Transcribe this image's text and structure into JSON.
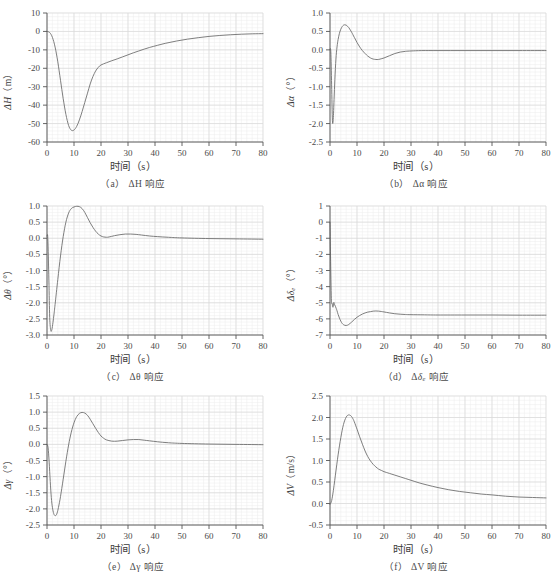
{
  "figure": {
    "background": "#ffffff",
    "line_color": "#6f6f6f",
    "axis_color": "#555555",
    "grid_major_color": "#d8d8d8",
    "grid_minor_color": "#ececec",
    "text_color": "#4a4a4a",
    "xlabel_common": "时间（s）"
  },
  "panels": [
    {
      "id": "a",
      "caption": "（a） ΔH 响应",
      "caption_prefix": "（a）",
      "caption_symbol": "ΔH",
      "caption_suffix": "响应",
      "ylabel_main": "ΔH",
      "ylabel_unit": "（m）",
      "xlabel": "时间（s）"
    },
    {
      "id": "b",
      "caption": "（b） Δα 响应",
      "caption_prefix": "（b）",
      "caption_symbol": "Δα",
      "caption_suffix": "响应",
      "ylabel_main": "Δα",
      "ylabel_unit": "（°）",
      "xlabel": "时间（s）"
    },
    {
      "id": "c",
      "caption": "（c） Δθ 响应",
      "caption_prefix": "（c）",
      "caption_symbol": "Δθ",
      "caption_suffix": "响应",
      "ylabel_main": "Δθ",
      "ylabel_unit": "（°）",
      "xlabel": "时间（s）"
    },
    {
      "id": "d",
      "caption": "（d） Δδe 响应",
      "caption_prefix": "（d）",
      "caption_symbol": "Δδe",
      "caption_suffix": "响应",
      "ylabel_main": "Δδe",
      "ylabel_unit": "（°）",
      "xlabel": "时间（s）"
    },
    {
      "id": "e",
      "caption": "（e） Δγ 响应",
      "caption_prefix": "（e）",
      "caption_symbol": "Δγ",
      "caption_suffix": "响应",
      "ylabel_main": "Δγ",
      "ylabel_unit": "（°）",
      "xlabel": "时间（s）"
    },
    {
      "id": "f",
      "caption": "（f） ΔV 响应",
      "caption_prefix": "（f）",
      "caption_symbol": "ΔV",
      "caption_suffix": "响应",
      "ylabel_main": "ΔV",
      "ylabel_unit": "（m/s）",
      "xlabel": "时间（s）"
    }
  ],
  "chart_data": [
    {
      "panel": "a",
      "type": "line",
      "title": "（a） ΔH 响应",
      "xlabel": "时间（s）",
      "ylabel": "ΔH（m）",
      "xlim": [
        0,
        80
      ],
      "ylim": [
        -60,
        10
      ],
      "xticks": [
        0,
        10,
        20,
        30,
        40,
        50,
        60,
        70,
        80
      ],
      "yticks": [
        10,
        0,
        -10,
        -20,
        -30,
        -40,
        -50,
        -60
      ],
      "grid": true,
      "legend": "none",
      "series": [
        {
          "name": "ΔH",
          "x": [
            0,
            1,
            2,
            3,
            4,
            5,
            6,
            7,
            8,
            9,
            10,
            11,
            12,
            13,
            14,
            15,
            16,
            17,
            18,
            19,
            20,
            22,
            24,
            26,
            28,
            30,
            32,
            34,
            36,
            38,
            40,
            44,
            48,
            52,
            56,
            60,
            64,
            68,
            72,
            76,
            80
          ],
          "y": [
            0,
            -0.6,
            -3.2,
            -8.5,
            -16.5,
            -26.5,
            -36.5,
            -45.0,
            -51.0,
            -53.6,
            -53.5,
            -51.5,
            -48.0,
            -43.5,
            -38.5,
            -33.5,
            -28.5,
            -24.5,
            -21.5,
            -19.5,
            -18.2,
            -17.0,
            -15.9,
            -14.9,
            -13.8,
            -12.7,
            -11.6,
            -10.6,
            -9.6,
            -8.7,
            -7.9,
            -6.4,
            -5.2,
            -4.2,
            -3.4,
            -2.7,
            -2.2,
            -1.8,
            -1.5,
            -1.3,
            -1.2
          ]
        }
      ]
    },
    {
      "panel": "b",
      "type": "line",
      "title": "（b） Δα 响应",
      "xlabel": "时间（s）",
      "ylabel": "Δα（°）",
      "xlim": [
        0,
        80
      ],
      "ylim": [
        -2.5,
        1.0
      ],
      "xticks": [
        0,
        10,
        20,
        30,
        40,
        50,
        60,
        70,
        80
      ],
      "yticks": [
        1.0,
        0.5,
        0.0,
        -0.5,
        -1.0,
        -1.5,
        -2.0,
        -2.5
      ],
      "grid": true,
      "legend": "none",
      "series": [
        {
          "name": "Δα",
          "x": [
            0,
            0.3,
            0.6,
            0.9,
            1.2,
            1.5,
            1.8,
            2.2,
            2.6,
            3.0,
            3.5,
            4.0,
            4.5,
            5.0,
            5.5,
            6.0,
            6.5,
            7.0,
            7.5,
            8.0,
            9.0,
            10.0,
            11.0,
            12.0,
            13.0,
            14.0,
            15.0,
            16.0,
            17.0,
            18.0,
            20.0,
            22.0,
            24.0,
            26.0,
            28.0,
            30.0,
            34.0,
            40.0,
            50.0,
            60.0,
            70.0,
            80.0
          ],
          "y": [
            0.0,
            -0.05,
            -0.95,
            -1.92,
            -1.88,
            -1.35,
            -0.8,
            -0.25,
            0.08,
            0.28,
            0.45,
            0.56,
            0.63,
            0.67,
            0.68,
            0.67,
            0.64,
            0.6,
            0.54,
            0.48,
            0.34,
            0.2,
            0.08,
            -0.02,
            -0.1,
            -0.17,
            -0.22,
            -0.25,
            -0.26,
            -0.26,
            -0.22,
            -0.16,
            -0.1,
            -0.06,
            -0.04,
            -0.03,
            -0.02,
            -0.02,
            -0.02,
            -0.02,
            -0.02,
            -0.02
          ]
        }
      ]
    },
    {
      "panel": "c",
      "type": "line",
      "title": "（c） Δθ 响应",
      "xlabel": "时间（s）",
      "ylabel": "Δθ（°）",
      "xlim": [
        0,
        80
      ],
      "ylim": [
        -3.0,
        1.0
      ],
      "xticks": [
        0,
        10,
        20,
        30,
        40,
        50,
        60,
        70,
        80
      ],
      "yticks": [
        1.0,
        0.5,
        0.0,
        -0.5,
        -1.0,
        -1.5,
        -2.0,
        -2.5,
        -3.0
      ],
      "grid": true,
      "legend": "none",
      "series": [
        {
          "name": "Δθ",
          "x": [
            0,
            0.3,
            0.7,
            1.0,
            1.4,
            1.8,
            2.2,
            2.6,
            3.0,
            4.0,
            5.0,
            6.0,
            7.0,
            8.0,
            9.0,
            10.0,
            11.0,
            12.0,
            13.0,
            14.0,
            15.0,
            16.0,
            17.0,
            18.0,
            19.0,
            20.0,
            21.0,
            22.0,
            23.0,
            25.0,
            27.0,
            29.0,
            31.0,
            33.0,
            35.0,
            38.0,
            41.0,
            45.0,
            50.0,
            60.0,
            70.0,
            80.0
          ],
          "y": [
            0.05,
            0.0,
            -1.3,
            -2.45,
            -2.86,
            -2.83,
            -2.62,
            -2.35,
            -2.05,
            -1.28,
            -0.55,
            0.05,
            0.5,
            0.78,
            0.92,
            0.97,
            0.99,
            0.98,
            0.92,
            0.8,
            0.64,
            0.48,
            0.34,
            0.22,
            0.13,
            0.07,
            0.04,
            0.03,
            0.04,
            0.08,
            0.11,
            0.13,
            0.13,
            0.12,
            0.1,
            0.07,
            0.05,
            0.03,
            0.01,
            -0.01,
            -0.02,
            -0.03
          ]
        }
      ]
    },
    {
      "panel": "d",
      "type": "line",
      "title": "（d） Δδe 响应",
      "xlabel": "时间（s）",
      "ylabel": "Δδe（°）",
      "xlim": [
        0,
        80
      ],
      "ylim": [
        -7,
        1
      ],
      "xticks": [
        0,
        10,
        20,
        30,
        40,
        50,
        60,
        70,
        80
      ],
      "yticks": [
        1,
        0,
        -1,
        -2,
        -3,
        -4,
        -5,
        -6,
        -7
      ],
      "grid": true,
      "legend": "none",
      "series": [
        {
          "name": "Δδe",
          "x": [
            0,
            0.2,
            0.5,
            0.8,
            1.1,
            1.4,
            1.7,
            2.0,
            2.3,
            2.6,
            3.0,
            3.5,
            4.0,
            4.5,
            5.0,
            5.5,
            6.0,
            6.5,
            7.0,
            8.0,
            9.0,
            10.0,
            11.0,
            12.0,
            13.0,
            14.0,
            15.0,
            16.0,
            17.0,
            18.0,
            19.0,
            20.0,
            22.0,
            24.0,
            26.0,
            28.0,
            30.0,
            35.0,
            40.0,
            50.0,
            60.0,
            70.0,
            80.0
          ],
          "y": [
            0.0,
            -2.1,
            -4.75,
            -5.05,
            -5.28,
            -4.98,
            -5.12,
            -5.22,
            -5.35,
            -5.5,
            -5.72,
            -5.95,
            -6.14,
            -6.28,
            -6.36,
            -6.4,
            -6.41,
            -6.39,
            -6.34,
            -6.2,
            -6.04,
            -5.9,
            -5.79,
            -5.7,
            -5.63,
            -5.58,
            -5.55,
            -5.52,
            -5.51,
            -5.52,
            -5.54,
            -5.57,
            -5.63,
            -5.68,
            -5.71,
            -5.73,
            -5.74,
            -5.75,
            -5.76,
            -5.76,
            -5.76,
            -5.77,
            -5.77
          ]
        }
      ]
    },
    {
      "panel": "e",
      "type": "line",
      "title": "（e） Δγ 响应",
      "xlabel": "时间（s）",
      "ylabel": "Δγ（°）",
      "xlim": [
        0,
        80
      ],
      "ylim": [
        -2.5,
        1.5
      ],
      "xticks": [
        0,
        10,
        20,
        30,
        40,
        50,
        60,
        70,
        80
      ],
      "yticks": [
        1.5,
        1.0,
        0.5,
        0.0,
        -0.5,
        -1.0,
        -1.5,
        -2.0,
        -2.5
      ],
      "grid": true,
      "legend": "none",
      "series": [
        {
          "name": "Δγ",
          "x": [
            0,
            0.4,
            0.8,
            1.2,
            1.6,
            2.0,
            2.5,
            3.0,
            3.5,
            4.0,
            4.5,
            5.0,
            6.0,
            7.0,
            8.0,
            9.0,
            10.0,
            11.0,
            12.0,
            13.0,
            14.0,
            15.0,
            16.0,
            17.0,
            18.0,
            19.0,
            20.0,
            21.0,
            22.0,
            24.0,
            26.0,
            28.0,
            30.0,
            32.0,
            34.0,
            36.0,
            38.0,
            41.0,
            45.0,
            50.0,
            60.0,
            70.0,
            80.0
          ],
          "y": [
            0.0,
            -0.1,
            -0.55,
            -1.15,
            -1.65,
            -1.95,
            -2.15,
            -2.21,
            -2.18,
            -2.05,
            -1.85,
            -1.62,
            -1.08,
            -0.52,
            -0.02,
            0.38,
            0.67,
            0.86,
            0.96,
            0.99,
            0.97,
            0.9,
            0.78,
            0.64,
            0.5,
            0.37,
            0.26,
            0.19,
            0.14,
            0.1,
            0.1,
            0.12,
            0.14,
            0.15,
            0.15,
            0.13,
            0.11,
            0.08,
            0.05,
            0.03,
            0.01,
            0.0,
            -0.01
          ]
        }
      ]
    },
    {
      "panel": "f",
      "type": "line",
      "title": "（f） ΔV 响应",
      "xlabel": "时间（s）",
      "ylabel": "ΔV（m/s）",
      "xlim": [
        0,
        80
      ],
      "ylim": [
        -0.5,
        2.5
      ],
      "xticks": [
        0,
        10,
        20,
        30,
        40,
        50,
        60,
        70,
        80
      ],
      "yticks": [
        2.5,
        2.0,
        1.5,
        1.0,
        0.5,
        0.0,
        -0.5
      ],
      "grid": true,
      "legend": "none",
      "series": [
        {
          "name": "ΔV",
          "x": [
            0,
            0.5,
            1,
            1.5,
            2,
            2.5,
            3,
            3.5,
            4,
            4.5,
            5,
            5.5,
            6,
            6.5,
            7,
            7.5,
            8,
            8.5,
            9,
            10,
            11,
            12,
            13,
            14,
            15,
            16,
            17,
            18,
            19,
            20,
            21,
            22,
            24,
            26,
            28,
            30,
            33,
            36,
            40,
            44,
            48,
            52,
            56,
            60,
            65,
            70,
            75,
            80
          ],
          "y": [
            -0.02,
            0.04,
            0.2,
            0.42,
            0.66,
            0.9,
            1.13,
            1.34,
            1.53,
            1.7,
            1.84,
            1.94,
            2.01,
            2.05,
            2.06,
            2.05,
            2.02,
            1.97,
            1.9,
            1.73,
            1.55,
            1.38,
            1.22,
            1.09,
            0.99,
            0.91,
            0.85,
            0.8,
            0.77,
            0.74,
            0.72,
            0.7,
            0.66,
            0.62,
            0.58,
            0.54,
            0.48,
            0.43,
            0.37,
            0.32,
            0.28,
            0.25,
            0.22,
            0.2,
            0.17,
            0.15,
            0.14,
            0.13
          ]
        }
      ]
    }
  ]
}
